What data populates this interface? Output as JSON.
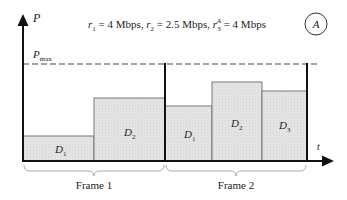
{
  "axes": {
    "y_label": "P",
    "x_label": "t",
    "pmax_label_main": "P",
    "pmax_label_sub": "max"
  },
  "header": {
    "r1_var": "r",
    "r1_sub": "1",
    "r1_value": " = 4 Mbps, ",
    "r2_var": "r",
    "r2_sub": "2",
    "r2_value": " = 2.5 Mbps, ",
    "r3_var": "r",
    "r3_sub": "3",
    "r3_sup": "A",
    "r3_value": " = 4 Mbps",
    "scenario_badge": "A"
  },
  "frames": [
    {
      "label": "Frame 1",
      "blocks": [
        {
          "label_main": "D",
          "label_sub": "1"
        },
        {
          "label_main": "D",
          "label_sub": "2"
        }
      ]
    },
    {
      "label": "Frame 2",
      "blocks": [
        {
          "label_main": "D",
          "label_sub": "1"
        },
        {
          "label_main": "D",
          "label_sub": "2"
        },
        {
          "label_main": "D",
          "label_sub": "3"
        }
      ]
    }
  ],
  "colors": {
    "block_fill": "#e3e3e3",
    "block_stroke": "#777777",
    "axis": "#111111",
    "brace": "#aaaaaa"
  }
}
